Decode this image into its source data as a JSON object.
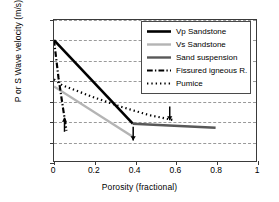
{
  "chart_data": {
    "type": "line",
    "title": "",
    "xlabel": "Porosity (fractional)",
    "ylabel": "P or S Wave velocity (m/s)",
    "xlim": [
      0,
      1
    ],
    "ylim": [
      0,
      7000
    ],
    "xticks": [
      "0",
      "0.2",
      "0.4",
      "0.6",
      "0.8",
      "1"
    ],
    "xtick_values": [
      0,
      0.2,
      0.4,
      0.6,
      0.8,
      1
    ],
    "yticks": [
      "0",
      "1 000",
      "2 000",
      "3 000",
      "4 000",
      "5 000",
      "6 000",
      "7 000"
    ],
    "ytick_values": [
      0,
      1000,
      2000,
      3000,
      4000,
      5000,
      6000,
      7000
    ],
    "grid": "horizontal-dashed",
    "legend_position": "top-right",
    "series": [
      {
        "name": "Vp Sandstone",
        "style": "solid",
        "color": "#000000",
        "width": 2.6,
        "points": [
          [
            0,
            6000
          ],
          [
            0.39,
            1850
          ]
        ]
      },
      {
        "name": "Vs Sandstone",
        "style": "solid",
        "color": "#b4b4b4",
        "width": 2.4,
        "points": [
          [
            0,
            3700
          ],
          [
            0.39,
            1200
          ]
        ]
      },
      {
        "name": "Sand suspension",
        "style": "solid",
        "color": "#585858",
        "width": 2.4,
        "points": [
          [
            0.39,
            1850
          ],
          [
            0.8,
            1650
          ]
        ]
      },
      {
        "name": "Fissured igneous R.",
        "style": "dashdot",
        "color": "#000000",
        "width": 2.2,
        "points": [
          [
            0,
            6000
          ],
          [
            0.022,
            4150
          ],
          [
            0.045,
            2600
          ],
          [
            0.062,
            1500
          ]
        ]
      },
      {
        "name": "Pumice",
        "style": "dotted",
        "color": "#000000",
        "width": 2.2,
        "points": [
          [
            0,
            4050
          ],
          [
            0.04,
            3760
          ],
          [
            0.2,
            3150
          ],
          [
            0.33,
            2700
          ],
          [
            0.47,
            2280
          ],
          [
            0.6,
            2010
          ]
        ]
      }
    ],
    "annotations": [
      {
        "name": "arrow-up-low-porosity",
        "direction": "up",
        "x": 0.052,
        "y_tail": 1450,
        "y_head": 2150
      },
      {
        "name": "arrow-down-vs-sandstone-end",
        "direction": "down",
        "x": 0.392,
        "y_tail": 1700,
        "y_head": 1020
      },
      {
        "name": "arrow-down-pumice-end",
        "direction": "down",
        "x": 0.573,
        "y_tail": 2700,
        "y_head": 2020
      }
    ]
  }
}
